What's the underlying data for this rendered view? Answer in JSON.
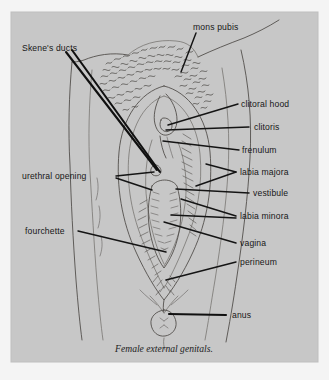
{
  "figure": {
    "caption": "Female external genitals.",
    "panel_color": "#c9c9c9",
    "page_color": "#f4f4f4",
    "ink_color": "#4b4845",
    "leader_color": "#141414"
  },
  "labels": {
    "skenes_ducts": "Skene's ducts",
    "mons_pubis": "mons pubis",
    "clitoral_hood": "clitoral hood",
    "clitoris": "clitoris",
    "frenulum": "frenulum",
    "labia_majora": "labia majora",
    "vestibule": "vestibule",
    "labia_minora": "labia minora",
    "vagina": "vagina",
    "perineum": "perineum",
    "anus": "anus",
    "urethral_opening": "urethral opening",
    "fourchette": "fourchette"
  }
}
